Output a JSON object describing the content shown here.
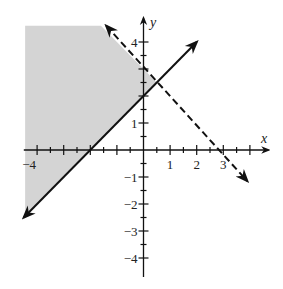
{
  "figure": {
    "type": "graph of system of linear inequalities",
    "background": "#ffffff",
    "shade_color": "#d4d4d4",
    "line_color": "#111111"
  },
  "axes": {
    "x_label": "x",
    "y_label": "y",
    "x_range": [
      -4.5,
      4.7
    ],
    "y_range": [
      -4.7,
      4.9
    ],
    "major_ticks": [
      -4,
      -3,
      -2,
      -1,
      1,
      2,
      3,
      4
    ],
    "minor_tick_step": 0.5,
    "x_tick_labels": [
      {
        "value": -4,
        "text": "−4"
      },
      {
        "value": 1,
        "text": "1"
      },
      {
        "value": 2,
        "text": "2"
      },
      {
        "value": 3,
        "text": "3"
      }
    ],
    "y_tick_labels": [
      {
        "value": 4,
        "text": "4"
      },
      {
        "value": 1,
        "text": "1"
      },
      {
        "value": -1,
        "text": "−1"
      },
      {
        "value": -2,
        "text": "−2"
      },
      {
        "value": -3,
        "text": "−3"
      },
      {
        "value": -4,
        "text": "−4"
      }
    ]
  },
  "lines": [
    {
      "name": "boundary-solid",
      "equation": "y = x + 2",
      "style": "solid",
      "from": [
        -4.5,
        -2.5
      ],
      "to": [
        2.0,
        4.0
      ]
    },
    {
      "name": "boundary-dashed",
      "equation": "y = -x + 3",
      "style": "dashed",
      "from": [
        -1.4,
        4.6
      ],
      "to": [
        3.9,
        -1.15
      ]
    }
  ],
  "shaded_region": {
    "description": "y >= x + 2 and y < -x + 3",
    "vertices": [
      [
        -4.45,
        4.6
      ],
      [
        -1.6,
        4.6
      ],
      [
        0.5,
        2.5
      ],
      [
        -4.45,
        -2.45
      ]
    ]
  }
}
